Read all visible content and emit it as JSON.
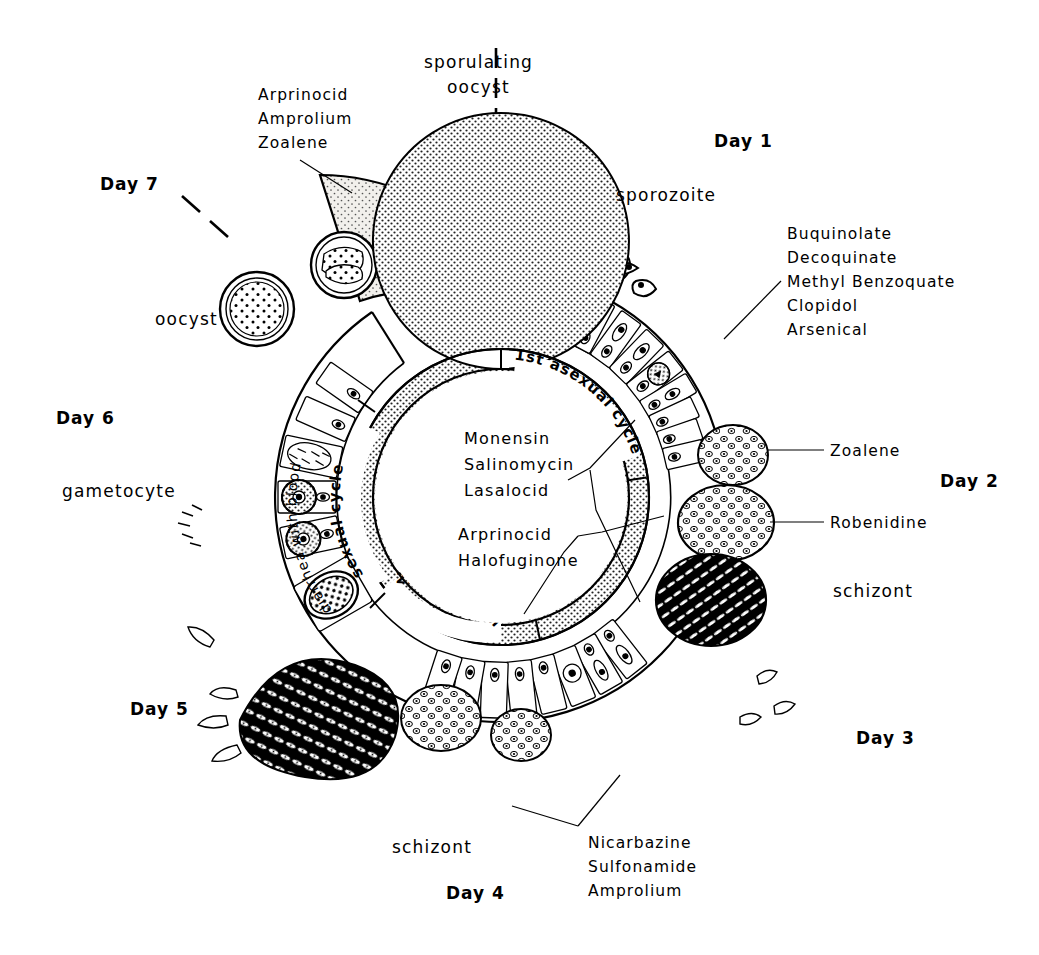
{
  "diagram": {
    "type": "life-cycle-wheel"
  },
  "days": [
    {
      "id": "day1",
      "label": "Day 1",
      "x": 714,
      "y": 147
    },
    {
      "id": "day2",
      "label": "Day 2",
      "x": 940,
      "y": 487
    },
    {
      "id": "day3",
      "label": "Day 3",
      "x": 856,
      "y": 744
    },
    {
      "id": "day4",
      "label": "Day 4",
      "x": 446,
      "y": 899
    },
    {
      "id": "day5",
      "label": "Day 5",
      "x": 130,
      "y": 715
    },
    {
      "id": "day6",
      "label": "Day 6",
      "x": 56,
      "y": 424
    },
    {
      "id": "day7",
      "label": "Day 7",
      "x": 100,
      "y": 190
    }
  ],
  "stage_labels": [
    {
      "id": "sporulating-oocyst",
      "line1": "sporulating",
      "line2": "oocyst",
      "x": 424,
      "y": 68
    },
    {
      "id": "sporozoite",
      "label": "sporozoite",
      "x": 616,
      "y": 201
    },
    {
      "id": "schizont-right",
      "label": "schizont",
      "x": 833,
      "y": 597
    },
    {
      "id": "schizont-bottom",
      "label": "schizont",
      "x": 392,
      "y": 853
    },
    {
      "id": "gametocyte",
      "label": "gametocyte",
      "x": 62,
      "y": 497
    },
    {
      "id": "oocyst",
      "label": "oocyst",
      "x": 155,
      "y": 325
    }
  ],
  "drug_callouts": [
    {
      "id": "arprinocid-group-top",
      "lines": [
        "Arprinocid",
        "Amprolium",
        "Zoalene"
      ],
      "x": 258,
      "y": 100,
      "leader": [
        [
          300,
          143
        ],
        [
          348,
          185
        ]
      ]
    },
    {
      "id": "buquinolate-group",
      "lines": [
        "Buquinolate",
        "Decoquinate",
        "Methyl Benzoquate",
        "Clopidol",
        "Arsenical"
      ],
      "x": 787,
      "y": 239,
      "leader": [
        [
          780,
          272
        ],
        [
          727,
          320
        ]
      ]
    },
    {
      "id": "zoalene-callout",
      "lines": [
        "Zoalene"
      ],
      "x": 830,
      "y": 456,
      "leader": [
        [
          824,
          450
        ],
        [
          785,
          450
        ]
      ]
    },
    {
      "id": "robenidine-callout",
      "lines": [
        "Robenidine"
      ],
      "x": 830,
      "y": 528,
      "leader": [
        [
          824,
          522
        ],
        [
          788,
          522
        ]
      ]
    },
    {
      "id": "nicarbazine-group",
      "lines": [
        "Nicarbazine",
        "Sulfonamide",
        "Amprolium"
      ],
      "x": 588,
      "y": 848,
      "leader": [
        [
          580,
          826
        ],
        [
          552,
          806
        ]
      ]
    }
  ],
  "center_drugs": {
    "group1": [
      "Monensin",
      "Salinomycin",
      "Lasalocid"
    ],
    "group2": [
      "Arprinocid",
      "Halofuginone"
    ],
    "group1_x": 464,
    "group1_y": 444,
    "group2_x": 458,
    "group2_y": 522
  },
  "ring_text": {
    "first_asexual": "1st asexual cycle",
    "second_asexual": "2nd asexual cycle",
    "sexual": "sexual cycle"
  },
  "outer_text": {
    "diarrhea": "diarrhea with blood"
  },
  "colors": {
    "ink": "#000000",
    "paper": "#ffffff",
    "stipple": "#3a3a3a",
    "wedge_fill": "#f2f0ec"
  }
}
